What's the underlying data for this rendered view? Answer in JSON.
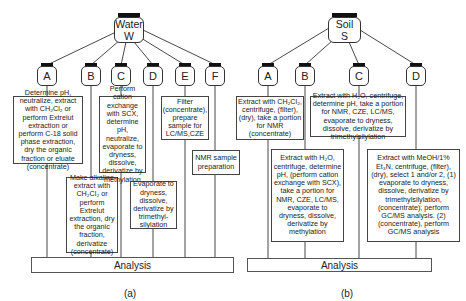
{
  "panel_a": {
    "caption": "(a)",
    "root": {
      "line1": "Water",
      "line2": "W"
    },
    "branches": [
      {
        "label": "A",
        "text": "Determine pH, neutralize, extract with CH₂Cl₂ or perform Extrelut extraction or perform C-18 solid phase extraction, dry the organic fraction or eluate (concentrate)"
      },
      {
        "label": "B",
        "text": "Make alkaline extract with CH₂Cl₂ or perform Extrelut extraction, dry the organic fraction, derivatize (concentrate)"
      },
      {
        "label": "C",
        "text": "Perform cation exchange with SCX, determine pH, neutralize, evaporate to dryness, dissolve, derivatize by methylation"
      },
      {
        "label": "D",
        "text": "Evaporate to dryness, dissolve, derivatize by trimethyl-silylation"
      },
      {
        "label": "E",
        "text": "Filter (concentrate), prepare sample for LC/MS,CZE"
      },
      {
        "label": "F",
        "text": "NMR sample preparation"
      }
    ],
    "analysis": "Analysis"
  },
  "panel_b": {
    "caption": "(b)",
    "root": {
      "line1": "Soil",
      "line2": "S"
    },
    "branches": [
      {
        "label": "A",
        "text": "Extract with CH₂Cl₂, centrifuge, (filter), (dry), take a portion for NMR (concentrate)"
      },
      {
        "label": "B",
        "text": "Extract with H₂O, centrifuge, determine pH, (perform cation exchange with SCX), take a portion for NMR, CZE, LC/MS, evaporate to dryness, dissolve, derivatize by methylation"
      },
      {
        "label": "C",
        "text": "Extract with H₂O, centrifuge, determine pH, take a portion for NMR, CZE, LC/MS, evaporate to dryness, dissolve, derivatize by trimethylsilylation"
      },
      {
        "label": "D",
        "text": "Extract with MeOH/1% Et₃N, centrifuge, (filter), (dry), select 1 and/or 2, (1) evaporate to dryness, dissolve, derivatize by trimethylsilylation, (concentrate); perform GC/MS analysis. (2) (concentrate), perform GC/MS analysis"
      }
    ],
    "analysis": "Analysis"
  }
}
